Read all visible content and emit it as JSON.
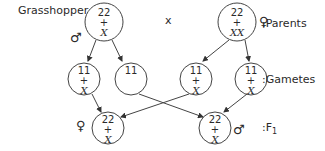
{
  "title_label": "Grasshopper",
  "cross_symbol": "x",
  "row_labels": {
    "parents": ":Parents",
    "gametes": ":Gametes",
    "f1": ":F",
    "f1_sub": "1"
  },
  "sex_symbols": {
    "male": "♂",
    "female": "♀"
  },
  "parents": [
    {
      "sex": "male",
      "autosomes": "22",
      "plus": "+",
      "sex_chromosomes": "X"
    },
    {
      "sex": "female",
      "autosomes": "22",
      "plus": "+",
      "sex_chromosomes": "XX"
    }
  ],
  "gametes": [
    {
      "autosomes": "11",
      "plus": "+",
      "sex_chromosomes": "X"
    },
    {
      "autosomes": "11",
      "plus": "",
      "sex_chromosomes": ""
    },
    {
      "autosomes": "11",
      "plus": "+",
      "sex_chromosomes": "X"
    },
    {
      "autosomes": "11",
      "plus": "+",
      "sex_chromosomes": "X"
    }
  ],
  "f1": [
    {
      "sex": "female",
      "autosomes": "22",
      "plus": "+",
      "sex_chromosomes": "X"
    },
    {
      "sex": "male",
      "autosomes": "22",
      "plus": "+",
      "sex_chromosomes": "X"
    }
  ]
}
